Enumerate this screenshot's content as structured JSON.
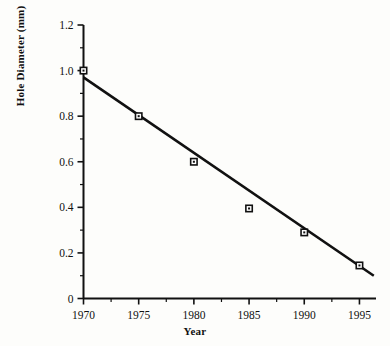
{
  "chart_data": {
    "type": "scatter",
    "title": "",
    "subtitle": "",
    "xlabel": "Year",
    "ylabel": "Hole Diameter (mm)",
    "xlim": [
      1970,
      1996.5
    ],
    "ylim": [
      0,
      1.2
    ],
    "grid": false,
    "legend": "none",
    "x_ticks": [
      1970,
      1975,
      1980,
      1985,
      1990,
      1995
    ],
    "x_tick_labels": [
      "1970",
      "1975",
      "1980",
      "1985",
      "1990",
      "1995"
    ],
    "x_minor_tick_step": 2.5,
    "y_ticks": [
      0,
      0.2,
      0.4,
      0.6,
      0.8,
      1.0,
      1.2
    ],
    "y_tick_labels": [
      "0",
      "0.2",
      "0.4",
      "0.6",
      "0.8",
      "1.0",
      "1.2"
    ],
    "y_minor_tick_step": 0.1,
    "marker": "open-square",
    "marker_color": "#111111",
    "line_color": "#111111",
    "x": [
      1970,
      1975,
      1980,
      1985,
      1990,
      1995
    ],
    "values": [
      1.0,
      0.8,
      0.6,
      0.395,
      0.29,
      0.145
    ],
    "series": [
      {
        "name": "Hole Diameter",
        "x": [
          1970,
          1975,
          1980,
          1985,
          1990,
          1995
        ],
        "values": [
          1.0,
          0.8,
          0.6,
          0.395,
          0.29,
          0.145
        ]
      }
    ],
    "trend_line": {
      "type": "linear-fit",
      "x": [
        1970,
        1996.3
      ],
      "values": [
        0.97,
        0.1
      ]
    },
    "annotations": []
  },
  "axis_titles": {
    "x": "Year",
    "y": "Hole Diameter (mm)"
  },
  "colors": {
    "background": "#fdfdfb",
    "ink": "#111111"
  }
}
